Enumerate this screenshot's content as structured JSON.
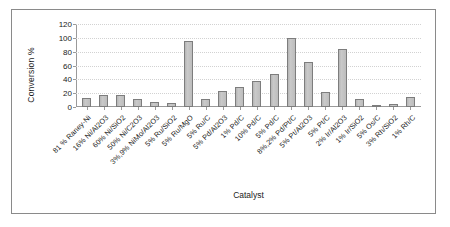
{
  "chart_data": {
    "type": "bar",
    "title": "",
    "subtitle": "",
    "xlabel": "Catalyst",
    "ylabel": "Conversion %",
    "ylim": [
      0,
      120
    ],
    "ytick_step": 20,
    "yticks": [
      "120",
      "100",
      "80",
      "60",
      "40",
      "20",
      "0"
    ],
    "grid": true,
    "legend": "none",
    "categories": [
      "81 % Raney-Ni",
      "16% Ni/Al2O3",
      "60% Ni/SiO2",
      "50% Ni/C2O3",
      "3%,9% NiMo/Al2O3",
      "5% Ru/SiO2",
      "5% Ru/MgO",
      "5% Ru/C",
      "5% Pd/Al2O3",
      "1% Pd/C",
      "10% Pd/C",
      "5% Pd/C",
      "8%,2% Pd/Pt/C",
      "5% Pt/Al2O3",
      "5% Pt/C",
      "2% Ir/Al2O3",
      "1% Ir/SiO2",
      "5% Os/C",
      "3% Rh/SiO2",
      "1% Rh/C"
    ],
    "values": [
      13,
      17,
      17,
      11,
      7,
      6,
      95,
      11,
      23,
      29,
      38,
      48,
      100,
      65,
      22,
      84,
      11,
      3,
      4,
      14
    ]
  },
  "axes": {
    "ylabel_text": "Conversion %",
    "xlabel_text": "Catalyst"
  }
}
